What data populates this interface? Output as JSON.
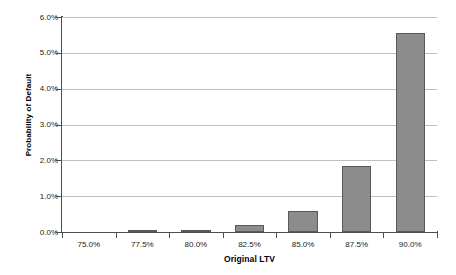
{
  "chart_data": {
    "type": "bar",
    "title": "",
    "subtitle": "",
    "xlabel": "Original LTV",
    "ylabel": "Probability of Default",
    "categories": [
      "75.0%",
      "77.5%",
      "80.0%",
      "82.5%",
      "85.0%",
      "87.5%",
      "90.0%"
    ],
    "values": [
      0.0,
      0.02,
      0.07,
      0.2,
      0.6,
      1.83,
      5.55
    ],
    "value_unit": "%",
    "ylim": [
      0.0,
      6.0
    ],
    "ytick_values": [
      0.0,
      1.0,
      2.0,
      3.0,
      4.0,
      5.0,
      6.0
    ],
    "ytick_labels": [
      "0.0%",
      "1.0%",
      "2.0%",
      "3.0%",
      "4.0%",
      "5.0%",
      "6.0%"
    ],
    "grid": true,
    "grid_axis": "y",
    "legend": false,
    "legend_position": "none",
    "series": [
      {
        "name": "Probability of Default",
        "values": [
          0.0,
          0.02,
          0.07,
          0.2,
          0.6,
          1.83,
          5.55
        ]
      }
    ],
    "colors": {
      "bar_fill": "#8c8c8c",
      "bar_border": "#595959",
      "gridline": "#bfbfbf",
      "axis": "#4d4d4d",
      "background": "#ffffff",
      "text": "#1a1a1a"
    }
  }
}
